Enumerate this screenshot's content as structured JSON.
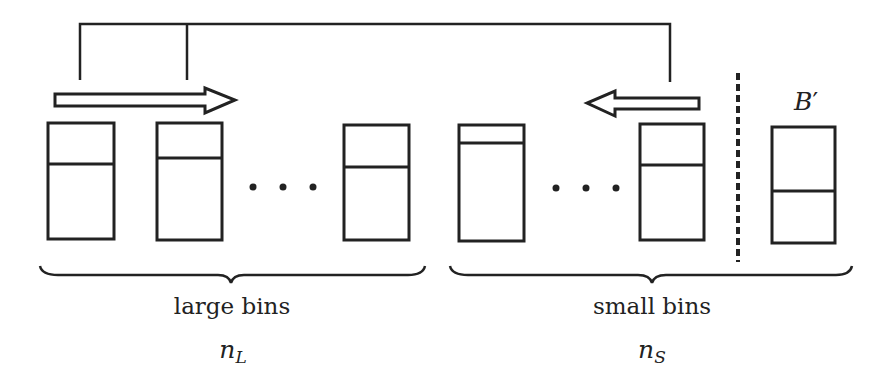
{
  "diagram": {
    "type": "bin-packing-illustration",
    "stroke_color": "#222222",
    "background_color": "#ffffff",
    "groups": [
      {
        "id": "large",
        "label": "large bins",
        "count_symbol": "n",
        "count_subscript": "L",
        "bins": [
          {
            "x": 48,
            "y": 123,
            "w": 66,
            "h": 116,
            "divider_y": 164
          },
          {
            "x": 157,
            "y": 123,
            "w": 65,
            "h": 117,
            "divider_y": 158
          },
          {
            "x": 344,
            "y": 125,
            "w": 65,
            "h": 115,
            "divider_y": 167
          }
        ],
        "ellipsis": "• • •",
        "arrow_direction": "right"
      },
      {
        "id": "small",
        "label": "small bins",
        "count_symbol": "n",
        "count_subscript": "S",
        "bins": [
          {
            "x": 459,
            "y": 125,
            "w": 65,
            "h": 116,
            "divider_y": 143
          },
          {
            "x": 640,
            "y": 124,
            "w": 64,
            "h": 116,
            "divider_y": 165
          }
        ],
        "ellipsis": "• • •",
        "arrow_direction": "left"
      }
    ],
    "separate_bin": {
      "label": "B",
      "prime": "′",
      "bin": {
        "x": 772,
        "y": 127,
        "w": 63,
        "h": 116,
        "divider_y": 191
      }
    },
    "separator": {
      "style": "dashed",
      "x": 738,
      "y1": 73,
      "y2": 262
    },
    "connector": {
      "top_y": 24,
      "drops": [
        {
          "x": 80,
          "bottom_y": 80
        },
        {
          "x": 187,
          "bottom_y": 80
        },
        {
          "x": 670,
          "bottom_y": 82
        }
      ]
    }
  }
}
